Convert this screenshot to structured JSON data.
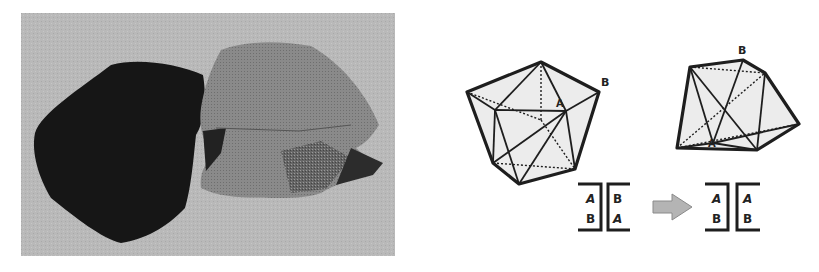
{
  "figure": {
    "photo": {
      "description": "Photograph of two knitted/felted polyhedron models, one black and one gray",
      "background_color": "#b9b9b9",
      "dark_model_color": "#1a1a1a",
      "light_model_color": "#8e8e8e"
    },
    "diagram": {
      "left_polyhedron": {
        "labels": {
          "a": "A",
          "b": "B"
        }
      },
      "right_polyhedron": {
        "labels": {
          "a": "A",
          "b": "B"
        }
      },
      "before_pair": {
        "left_bracket": {
          "top": "A",
          "bottom": "B"
        },
        "right_bracket": {
          "top": "B",
          "bottom": "A"
        }
      },
      "arrow": {
        "color": "#b0b0b0",
        "direction": "right"
      },
      "after_pair": {
        "left_bracket": {
          "top": "A",
          "bottom": "B"
        },
        "right_bracket": {
          "top": "A",
          "bottom": "B"
        }
      },
      "face_fill": "#ececec",
      "edge_color": "#1e1e1e"
    }
  }
}
